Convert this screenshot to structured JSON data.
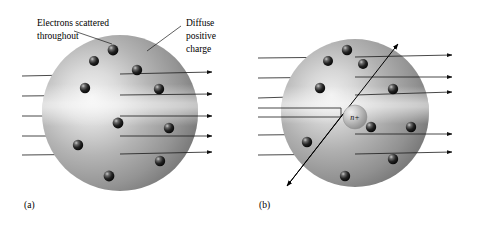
{
  "figure": {
    "background_color": "#ffffff",
    "width": 480,
    "height": 225
  },
  "annotations": {
    "electrons_label_line1": "Electrons scattered",
    "electrons_label_line2": "throughout",
    "charge_label_line1": "Diffuse",
    "charge_label_line2": "positive",
    "charge_label_line3": "charge"
  },
  "panels": [
    {
      "id": "a",
      "label": "(a)",
      "model": "plum-pudding",
      "sphere": {
        "cx": 120,
        "cy": 113,
        "r": 78,
        "fill_light": "#e8e8e8",
        "fill_mid": "#a8a8a8",
        "fill_dark": "#6e6e6e"
      },
      "electrons": [
        {
          "cx": 113,
          "cy": 50,
          "r": 5.4
        },
        {
          "cx": 94,
          "cy": 61,
          "r": 5.0
        },
        {
          "cx": 137,
          "cy": 70,
          "r": 5.2
        },
        {
          "cx": 85,
          "cy": 88,
          "r": 5.2
        },
        {
          "cx": 159,
          "cy": 89,
          "r": 5.2
        },
        {
          "cx": 118,
          "cy": 123,
          "r": 5.4
        },
        {
          "cx": 169,
          "cy": 128,
          "r": 5.2
        },
        {
          "cx": 78,
          "cy": 145,
          "r": 5.2
        },
        {
          "cx": 160,
          "cy": 161,
          "r": 5.2
        },
        {
          "cx": 109,
          "cy": 176,
          "r": 5.4
        }
      ],
      "beams": [
        {
          "x1": 22,
          "y1": 76,
          "x2": 212,
          "y2": 72
        },
        {
          "x1": 22,
          "y1": 96,
          "x2": 212,
          "y2": 94
        },
        {
          "x1": 22,
          "y1": 116,
          "x2": 212,
          "y2": 116
        },
        {
          "x1": 22,
          "y1": 136,
          "x2": 212,
          "y2": 136
        },
        {
          "x1": 22,
          "y1": 155,
          "x2": 212,
          "y2": 152
        }
      ],
      "beam_count": 5,
      "deflected": false
    },
    {
      "id": "b",
      "label": "(b)",
      "model": "rutherford-nuclear",
      "sphere": {
        "cx": 355,
        "cy": 113,
        "r": 74,
        "fill_light": "#e4e4e4",
        "fill_mid": "#a4a4a4",
        "fill_dark": "#6a6a6a"
      },
      "nucleus": {
        "cx": 355,
        "cy": 117,
        "r": 12,
        "label": "n+"
      },
      "electrons": [
        {
          "cx": 347,
          "cy": 50,
          "r": 5.2
        },
        {
          "cx": 328,
          "cy": 61,
          "r": 5.0
        },
        {
          "cx": 363,
          "cy": 64,
          "r": 5.0
        },
        {
          "cx": 320,
          "cy": 88,
          "r": 5.2
        },
        {
          "cx": 393,
          "cy": 89,
          "r": 5.2
        },
        {
          "cx": 371,
          "cy": 127,
          "r": 5.2
        },
        {
          "cx": 411,
          "cy": 127,
          "r": 5.2
        },
        {
          "cx": 307,
          "cy": 142,
          "r": 5.2
        },
        {
          "cx": 393,
          "cy": 159,
          "r": 5.2
        },
        {
          "cx": 345,
          "cy": 176,
          "r": 5.2
        }
      ],
      "beams": [
        {
          "x1": 258,
          "y1": 58,
          "x2": 452,
          "y2": 55
        },
        {
          "x1": 258,
          "y1": 78,
          "x2": 452,
          "y2": 77
        },
        {
          "x1": 258,
          "y1": 98,
          "x2": 452,
          "y2": 92
        },
        {
          "x1": 258,
          "y1": 135,
          "x2": 452,
          "y2": 134
        },
        {
          "x1": 258,
          "y1": 155,
          "x2": 452,
          "y2": 152
        }
      ],
      "beam_count": 5,
      "deflected": true,
      "deflected_beam": {
        "entry_x1": 258,
        "entry_y1": 112,
        "entry_x2": 340,
        "entry_y2": 118,
        "out_up_x": 400,
        "out_up_y": 45,
        "out_down_x": 290,
        "out_down_y": 188
      }
    }
  ],
  "leaders": [
    {
      "name": "electrons-leader",
      "x1": 112,
      "y1": 40,
      "x2": 74,
      "y2": 30
    },
    {
      "name": "charge-leader",
      "x1": 148,
      "y1": 50,
      "x2": 180,
      "y2": 26
    }
  ]
}
